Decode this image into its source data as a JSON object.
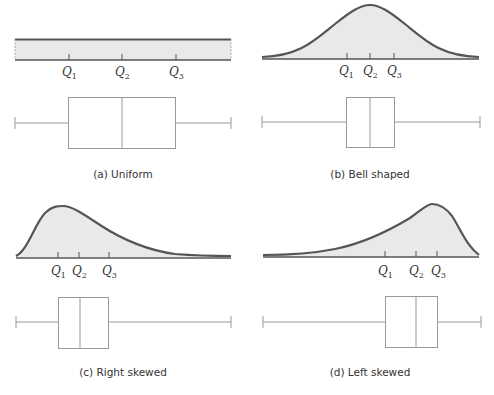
{
  "colors": {
    "curve_stroke": "#555555",
    "curve_fill": "#e9e9e9",
    "box_stroke": "#9a9a9a",
    "text": "#333333"
  },
  "panels": [
    {
      "id": "a",
      "caption": "(a)  Uniform",
      "shape": "uniform",
      "quartile_labels": [
        "Q",
        "Q",
        "Q"
      ],
      "quartile_subscripts": [
        "1",
        "2",
        "3"
      ]
    },
    {
      "id": "b",
      "caption": "(b)  Bell shaped",
      "shape": "bell",
      "quartile_labels": [
        "Q",
        "Q",
        "Q"
      ],
      "quartile_subscripts": [
        "1",
        "2",
        "3"
      ]
    },
    {
      "id": "c",
      "caption": "(c)  Right skewed",
      "shape": "right-skewed",
      "quartile_labels": [
        "Q",
        "Q",
        "Q"
      ],
      "quartile_subscripts": [
        "1",
        "2",
        "3"
      ]
    },
    {
      "id": "d",
      "caption": "(d)  Left skewed",
      "shape": "left-skewed",
      "quartile_labels": [
        "Q",
        "Q",
        "Q"
      ],
      "quartile_subscripts": [
        "1",
        "2",
        "3"
      ]
    }
  ]
}
